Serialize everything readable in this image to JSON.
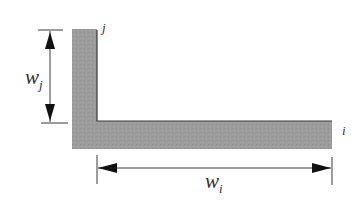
{
  "diagram": {
    "title": "",
    "colors": {
      "bar_fill": "#9a9a9a",
      "bar_edge": "#333333",
      "dimension_line": "#3a3a3a",
      "label": "#333333",
      "background": "#ffffff"
    },
    "labels": {
      "vertical_member": "j",
      "horizontal_member": "i",
      "vertical_width_symbol": "w",
      "vertical_width_subscript": "j",
      "horizontal_width_symbol": "w",
      "horizontal_width_subscript": "i"
    },
    "shapes": {
      "vertical_bar": {
        "x": 72,
        "y": 29,
        "width": 25,
        "height": 120
      },
      "horizontal_bar": {
        "x": 72,
        "y": 121,
        "width": 260,
        "height": 28
      }
    },
    "dimensions": {
      "w_j": {
        "orientation": "vertical",
        "from_y": 30,
        "to_y": 123,
        "line_x": 50
      },
      "w_i": {
        "orientation": "horizontal",
        "from_x": 97,
        "to_x": 332,
        "line_y": 168
      }
    }
  }
}
